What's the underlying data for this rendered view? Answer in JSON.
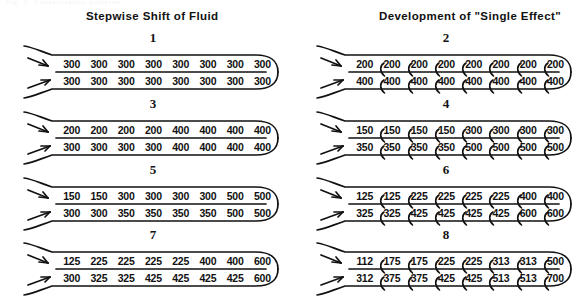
{
  "figure": {
    "ghost_caption": "Fig. 3.   Concentration   patterns",
    "headers": {
      "left": "Stepwise Shift of Fluid",
      "right": "Development of \"Single Effect\""
    }
  },
  "panels": [
    {
      "id": "panel-1",
      "number": "1",
      "column": "left",
      "connectors": false,
      "top_row": [
        "300",
        "300",
        "300",
        "300",
        "300",
        "300",
        "300",
        "300"
      ],
      "bottom_row": [
        "300",
        "300",
        "300",
        "300",
        "300",
        "300",
        "300",
        "300"
      ]
    },
    {
      "id": "panel-2",
      "number": "2",
      "column": "right",
      "connectors": true,
      "top_row": [
        "200",
        "200",
        "200",
        "200",
        "200",
        "200",
        "200",
        "200"
      ],
      "bottom_row": [
        "400",
        "400",
        "400",
        "400",
        "400",
        "400",
        "400",
        "400"
      ]
    },
    {
      "id": "panel-3",
      "number": "3",
      "column": "left",
      "connectors": false,
      "top_row": [
        "200",
        "200",
        "200",
        "200",
        "400",
        "400",
        "400",
        "400"
      ],
      "bottom_row": [
        "300",
        "300",
        "300",
        "300",
        "400",
        "400",
        "400",
        "400"
      ]
    },
    {
      "id": "panel-4",
      "number": "4",
      "column": "right",
      "connectors": true,
      "top_row": [
        "150",
        "150",
        "150",
        "150",
        "300",
        "300",
        "300",
        "300"
      ],
      "bottom_row": [
        "350",
        "350",
        "350",
        "350",
        "500",
        "500",
        "500",
        "500"
      ]
    },
    {
      "id": "panel-5",
      "number": "5",
      "column": "left",
      "connectors": false,
      "top_row": [
        "150",
        "150",
        "300",
        "300",
        "300",
        "300",
        "500",
        "500"
      ],
      "bottom_row": [
        "300",
        "300",
        "350",
        "350",
        "350",
        "350",
        "500",
        "500"
      ]
    },
    {
      "id": "panel-6",
      "number": "6",
      "column": "right",
      "connectors": true,
      "top_row": [
        "125",
        "125",
        "225",
        "225",
        "225",
        "225",
        "400",
        "400"
      ],
      "bottom_row": [
        "325",
        "325",
        "425",
        "425",
        "425",
        "425",
        "600",
        "600"
      ]
    },
    {
      "id": "panel-7",
      "number": "7",
      "column": "left",
      "connectors": false,
      "top_row": [
        "125",
        "225",
        "225",
        "225",
        "225",
        "400",
        "400",
        "600"
      ],
      "bottom_row": [
        "300",
        "325",
        "325",
        "425",
        "425",
        "425",
        "425",
        "600"
      ]
    },
    {
      "id": "panel-8",
      "number": "8",
      "column": "right",
      "connectors": true,
      "top_row": [
        "112",
        "175",
        "175",
        "225",
        "225",
        "313",
        "313",
        "500"
      ],
      "bottom_row": [
        "312",
        "375",
        "375",
        "425",
        "425",
        "513",
        "513",
        "700"
      ]
    }
  ],
  "chart_data": {
    "type": "diagram",
    "panel_order": [
      "1",
      "2",
      "3",
      "4",
      "5",
      "6",
      "7",
      "8"
    ],
    "cells_per_row": 8
  },
  "colors": {
    "ink": "#111111",
    "background": "#ffffff"
  }
}
